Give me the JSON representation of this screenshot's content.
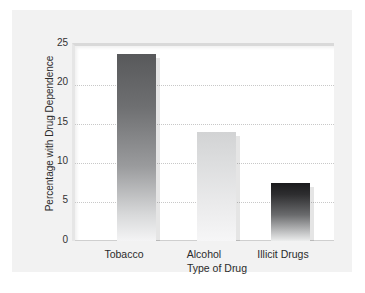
{
  "chart_data": {
    "type": "bar",
    "title": "",
    "subtitle": "",
    "categories": [
      "Tobacco",
      "Alcohol",
      "Illicit Drugs"
    ],
    "values": [
      24,
      14,
      7.5
    ],
    "xlabel": "Type of Drug",
    "ylabel": "Percentage with Drug Dependence",
    "ylim": [
      0,
      25
    ],
    "yticks": [
      0,
      5,
      10,
      15,
      20,
      25
    ],
    "ytick_labels": [
      "0",
      "5",
      "10",
      "15",
      "20",
      "25"
    ],
    "grid": true,
    "grid_axis": "y",
    "grid_style": "dotted",
    "legend": false,
    "legend_position": "none",
    "annotations": [],
    "series": [
      {
        "name": "Percentage with Drug Dependence",
        "values": [
          24,
          14,
          7.5
        ]
      }
    ],
    "bar_styles": [
      {
        "category": "Tobacco",
        "gradient_top": "#58595b",
        "gradient_bottom": "#f4f4f5"
      },
      {
        "category": "Alcohol",
        "gradient_top": "#d2d3d4",
        "gradient_bottom": "#f6f6f7"
      },
      {
        "category": "Illicit Drugs",
        "gradient_top": "#1a1a1c",
        "gradient_bottom": "#eceded"
      }
    ]
  },
  "colors": {
    "page_background": "#ffffff",
    "card_background": "#f2f2f2",
    "plot_background": "#ffffff",
    "gridline": "#c8c8c8",
    "axis_line": "#cfcfcf",
    "text": "#2b2b2b"
  }
}
